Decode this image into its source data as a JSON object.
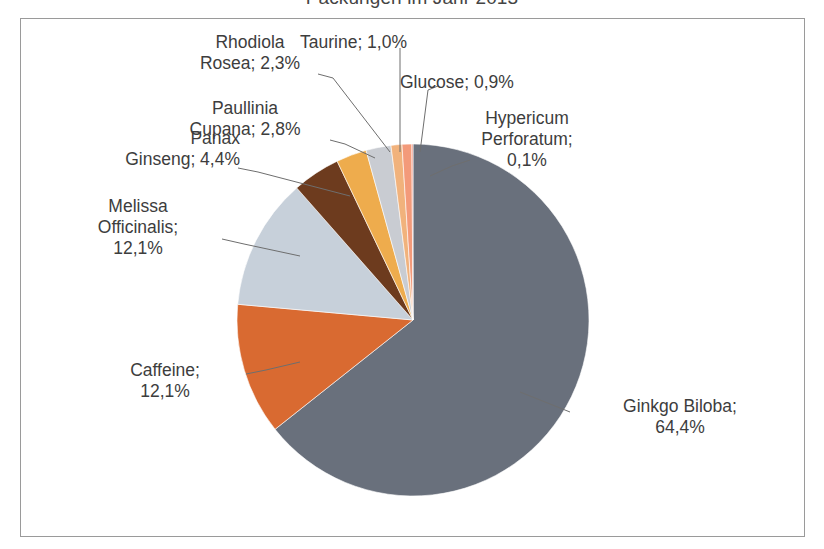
{
  "chart": {
    "title": "Packungen im Jahr 2013",
    "frame_color": "#9a9a9a",
    "background": "#ffffff"
  },
  "chart_data": {
    "type": "pie",
    "title": "Packungen im Jahr 2013",
    "xlabel": "",
    "ylabel": "",
    "legend_position": "none",
    "grid": false,
    "value_suffix": "%",
    "decimal_separator": ",",
    "categories": [
      "Ginkgo Biloba",
      "Caffeine",
      "Melissa Officinalis",
      "Panax Ginseng",
      "Paullinia Cupana",
      "Rhodiola Rosea",
      "Taurine",
      "Glucose",
      "Hypericum Perforatum"
    ],
    "values": [
      64.4,
      12.1,
      12.1,
      4.4,
      2.8,
      2.3,
      1.0,
      0.9,
      0.1
    ],
    "colors": [
      "#69707c",
      "#d96a31",
      "#c7d0da",
      "#6d3b1e",
      "#eeac4d",
      "#c9ccd2",
      "#f1b27c",
      "#f39a7a",
      "#e8806e"
    ],
    "slices": [
      {
        "label": "Ginkgo Biloba",
        "value": 64.4,
        "display": "64,4%",
        "color": "#69707c"
      },
      {
        "label": "Caffeine",
        "value": 12.1,
        "display": "12,1%",
        "color": "#d96a31"
      },
      {
        "label": "Melissa Officinalis",
        "value": 12.1,
        "display": "12,1%",
        "color": "#c7d0da"
      },
      {
        "label": "Panax Ginseng",
        "value": 4.4,
        "display": "4,4%",
        "color": "#6d3b1e"
      },
      {
        "label": "Paullinia Cupana",
        "value": 2.8,
        "display": "2,8%",
        "color": "#eeac4d"
      },
      {
        "label": "Rhodiola Rosea",
        "value": 2.3,
        "display": "2,3%",
        "color": "#c9ccd2"
      },
      {
        "label": "Taurine",
        "value": 1.0,
        "display": "1,0%",
        "color": "#f1b27c"
      },
      {
        "label": "Glucose",
        "value": 0.9,
        "display": "0,9%",
        "color": "#f39a7a"
      },
      {
        "label": "Hypericum Perforatum",
        "value": 0.1,
        "display": "0,1%",
        "color": "#e8806e"
      }
    ]
  },
  "labels": {
    "ginkgo": "Ginkgo Biloba;\n64,4%",
    "caffeine": "Caffeine;\n12,1%",
    "melissa": "Melissa\nOfficinalis;\n12,1%",
    "panax": "Panax\nGinseng; 4,4%",
    "paullinia": "Paullinia\nCupana; 2,8%",
    "rhodiola": "Rhodiola\nRosea; 2,3%",
    "taurine": "Taurine; 1,0%",
    "glucose": "Glucose; 0,9%",
    "hypericum": "Hypericum\nPerforatum;\n0,1%"
  }
}
